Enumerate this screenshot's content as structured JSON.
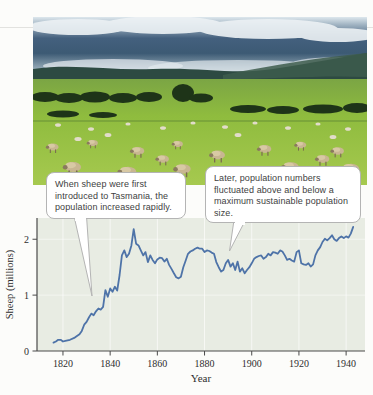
{
  "figure": {
    "photo_alt": "Sheep grazing in a green Tasmanian pasture with hills and cloudy sky",
    "callouts": {
      "left": "When sheep were first introduced to Tasmania, the population increased rapidly.",
      "right": "Later, population numbers fluctuated above and below a maximum sustainable population size."
    }
  },
  "chart_data": {
    "type": "line",
    "title": "",
    "xlabel": "Year",
    "ylabel": "Sheep (millions)",
    "x_ticks": [
      1820,
      1840,
      1860,
      1880,
      1900,
      1920,
      1940
    ],
    "y_ticks": [
      0,
      1,
      2
    ],
    "x_domain": [
      1809,
      1948
    ],
    "y_domain": [
      0,
      2.38
    ],
    "grid": true,
    "legend": "none",
    "line_color": "#4e73a8",
    "plot_bg": "#e8ece3",
    "axis_color": "#4a4a4a",
    "tick_label_color": "#2e2e2e",
    "series": [
      {
        "name": "Tasmanian sheep population",
        "points": [
          [
            1816,
            0.15
          ],
          [
            1817,
            0.17
          ],
          [
            1818,
            0.2
          ],
          [
            1819,
            0.2
          ],
          [
            1820,
            0.17
          ],
          [
            1821,
            0.18
          ],
          [
            1823,
            0.2
          ],
          [
            1825,
            0.24
          ],
          [
            1827,
            0.3
          ],
          [
            1828,
            0.36
          ],
          [
            1829,
            0.47
          ],
          [
            1830,
            0.52
          ],
          [
            1831,
            0.6
          ],
          [
            1832,
            0.67
          ],
          [
            1833,
            0.64
          ],
          [
            1834,
            0.71
          ],
          [
            1835,
            0.76
          ],
          [
            1836,
            0.74
          ],
          [
            1837,
            0.79
          ],
          [
            1838,
            1.09
          ],
          [
            1839,
            0.97
          ],
          [
            1840,
            1.12
          ],
          [
            1841,
            1.06
          ],
          [
            1842,
            1.15
          ],
          [
            1843,
            1.08
          ],
          [
            1844,
            1.36
          ],
          [
            1845,
            1.71
          ],
          [
            1846,
            1.8
          ],
          [
            1847,
            1.68
          ],
          [
            1848,
            1.74
          ],
          [
            1849,
            1.89
          ],
          [
            1850,
            2.18
          ],
          [
            1851,
            1.92
          ],
          [
            1852,
            1.89
          ],
          [
            1853,
            1.8
          ],
          [
            1854,
            1.71
          ],
          [
            1855,
            1.77
          ],
          [
            1856,
            1.59
          ],
          [
            1857,
            1.71
          ],
          [
            1858,
            1.63
          ],
          [
            1859,
            1.57
          ],
          [
            1860,
            1.64
          ],
          [
            1861,
            1.67
          ],
          [
            1862,
            1.66
          ],
          [
            1863,
            1.6
          ],
          [
            1864,
            1.65
          ],
          [
            1865,
            1.54
          ],
          [
            1866,
            1.47
          ],
          [
            1867,
            1.39
          ],
          [
            1868,
            1.32
          ],
          [
            1869,
            1.3
          ],
          [
            1870,
            1.33
          ],
          [
            1871,
            1.5
          ],
          [
            1872,
            1.62
          ],
          [
            1873,
            1.74
          ],
          [
            1874,
            1.78
          ],
          [
            1875,
            1.8
          ],
          [
            1876,
            1.83
          ],
          [
            1877,
            1.85
          ],
          [
            1878,
            1.83
          ],
          [
            1879,
            1.83
          ],
          [
            1880,
            1.77
          ],
          [
            1881,
            1.8
          ],
          [
            1882,
            1.79
          ],
          [
            1883,
            1.76
          ],
          [
            1884,
            1.74
          ],
          [
            1885,
            1.59
          ],
          [
            1886,
            1.5
          ],
          [
            1887,
            1.42
          ],
          [
            1888,
            1.45
          ],
          [
            1889,
            1.57
          ],
          [
            1890,
            1.63
          ],
          [
            1891,
            1.51
          ],
          [
            1892,
            1.57
          ],
          [
            1893,
            1.45
          ],
          [
            1894,
            1.6
          ],
          [
            1895,
            1.42
          ],
          [
            1896,
            1.48
          ],
          [
            1897,
            1.39
          ],
          [
            1898,
            1.45
          ],
          [
            1899,
            1.5
          ],
          [
            1900,
            1.57
          ],
          [
            1901,
            1.65
          ],
          [
            1902,
            1.68
          ],
          [
            1903,
            1.7
          ],
          [
            1904,
            1.71
          ],
          [
            1905,
            1.65
          ],
          [
            1906,
            1.68
          ],
          [
            1907,
            1.74
          ],
          [
            1908,
            1.71
          ],
          [
            1909,
            1.77
          ],
          [
            1910,
            1.76
          ],
          [
            1911,
            1.74
          ],
          [
            1912,
            1.8
          ],
          [
            1913,
            1.78
          ],
          [
            1914,
            1.71
          ],
          [
            1915,
            1.63
          ],
          [
            1916,
            1.65
          ],
          [
            1917,
            1.62
          ],
          [
            1918,
            1.6
          ],
          [
            1919,
            1.77
          ],
          [
            1920,
            1.8
          ],
          [
            1921,
            1.57
          ],
          [
            1922,
            1.55
          ],
          [
            1923,
            1.54
          ],
          [
            1924,
            1.57
          ],
          [
            1925,
            1.51
          ],
          [
            1926,
            1.55
          ],
          [
            1927,
            1.71
          ],
          [
            1928,
            1.8
          ],
          [
            1929,
            1.86
          ],
          [
            1930,
            1.95
          ],
          [
            1931,
            2.01
          ],
          [
            1932,
            1.98
          ],
          [
            1933,
            2.02
          ],
          [
            1934,
            2.07
          ],
          [
            1935,
            2.0
          ],
          [
            1936,
            1.97
          ],
          [
            1937,
            2.02
          ],
          [
            1938,
            2.05
          ],
          [
            1939,
            2.02
          ],
          [
            1940,
            2.05
          ],
          [
            1941,
            2.03
          ],
          [
            1942,
            2.1
          ],
          [
            1943,
            2.22
          ]
        ]
      }
    ]
  }
}
